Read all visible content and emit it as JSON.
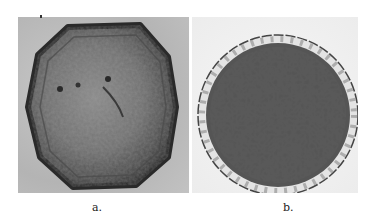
{
  "figure": {
    "panels": [
      {
        "id": "a",
        "label": "a.",
        "description": "Grayscale micrograph of a hexagonal, faceted grain with dark rim and mottled interior",
        "shape": "hexagon",
        "colors": {
          "background": "#bdbdbd",
          "body": "#6e6e6e",
          "rim": "#2e2e2e"
        }
      },
      {
        "id": "b",
        "label": "b.",
        "description": "Grayscale micrograph of a round grain with scalloped, lobed margin and reticulate (net-like) dark surface pattern",
        "shape": "circle",
        "colors": {
          "background": "#f2f2f2",
          "body": "#3a3a3a",
          "pattern": "#d8d8d8"
        }
      }
    ]
  }
}
